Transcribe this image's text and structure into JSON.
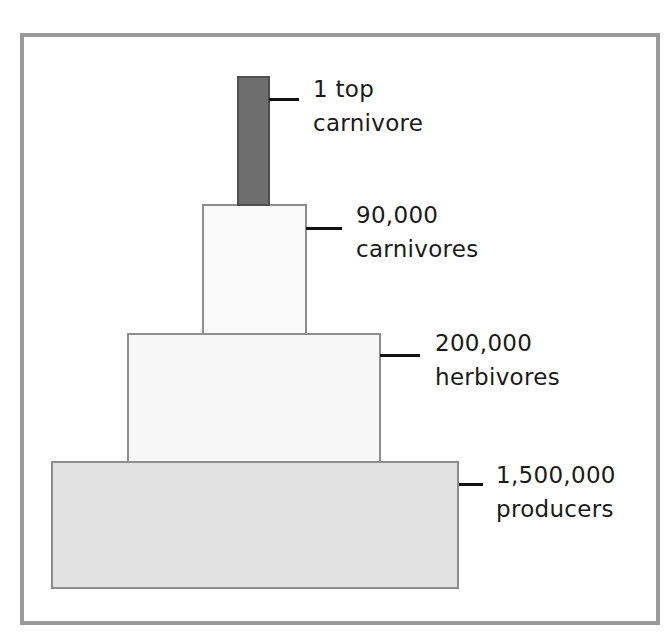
{
  "diagram": {
    "type": "ecological pyramid of numbers",
    "levels": [
      {
        "id": "top-carnivore",
        "count": "1 top",
        "name": "carnivore",
        "fill": "#6e6e6e"
      },
      {
        "id": "carnivores",
        "count": "90,000",
        "name": "carnivores",
        "fill": "#f9f9f9"
      },
      {
        "id": "herbivores",
        "count": "200,000",
        "name": "herbivores",
        "fill": "#f7f7f7"
      },
      {
        "id": "producers",
        "count": "1,500,000",
        "name": "producers",
        "fill": "#e2e2e2"
      }
    ],
    "frame_color": "#9a9a9a"
  }
}
